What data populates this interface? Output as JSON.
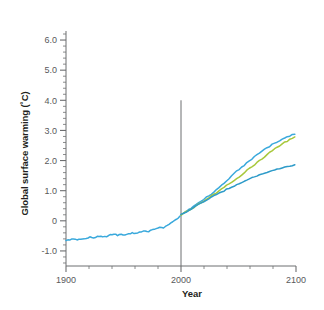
{
  "chart_data": {
    "type": "line",
    "title": "",
    "xlabel": "Year",
    "ylabel": "Global surface warming (˚C)",
    "xlim": [
      1900,
      2100
    ],
    "ylim": [
      -1.5,
      6.3
    ],
    "grid": false,
    "legend": "none",
    "x_major_ticks": [
      1900,
      2000,
      2100
    ],
    "x_major_tick_labels": [
      "1900",
      "2000",
      "2100"
    ],
    "x_minor_tick_step": 20,
    "y_major_ticks": [
      -1.0,
      0,
      1.0,
      2.0,
      3.0,
      4.0,
      5.0,
      6.0
    ],
    "y_major_tick_labels": [
      "-1.0",
      "0",
      "1.0",
      "2.0",
      "3.0",
      "4.0",
      "5.0",
      "6.0"
    ],
    "y_minor_tick_step": 0.2,
    "annotations": [
      {
        "name": "present-day-divider",
        "type": "vline",
        "x": 2000,
        "y_from": -1.5,
        "y_to": 4.0,
        "color": "#6d6e70"
      }
    ],
    "colors": {
      "historical": "#3aa9dc",
      "high_scenario": "#3aa9dc",
      "mid_scenario": "#a8c83c",
      "low_scenario": "#2e9bc9",
      "axis": "#6d6e70",
      "text": "#231f20",
      "tick_text": "#58595b"
    },
    "series": [
      {
        "name": "Historical observations",
        "color": "#3aa9dc",
        "x": [
          1900,
          1903,
          1906,
          1909,
          1912,
          1915,
          1918,
          1921,
          1924,
          1927,
          1930,
          1933,
          1936,
          1939,
          1942,
          1945,
          1948,
          1951,
          1954,
          1957,
          1960,
          1963,
          1966,
          1969,
          1972,
          1975,
          1978,
          1981,
          1984,
          1987,
          1990,
          1993,
          1996,
          1998,
          2000
        ],
        "values": [
          -0.65,
          -0.63,
          -0.6,
          -0.64,
          -0.59,
          -0.61,
          -0.57,
          -0.55,
          -0.57,
          -0.53,
          -0.52,
          -0.54,
          -0.5,
          -0.47,
          -0.45,
          -0.48,
          -0.44,
          -0.46,
          -0.43,
          -0.4,
          -0.42,
          -0.38,
          -0.36,
          -0.33,
          -0.35,
          -0.3,
          -0.26,
          -0.22,
          -0.24,
          -0.17,
          -0.1,
          -0.03,
          0.06,
          0.12,
          0.2
        ]
      },
      {
        "name": "High scenario",
        "color": "#3aa9dc",
        "x": [
          2000,
          2010,
          2020,
          2030,
          2040,
          2050,
          2060,
          2070,
          2080,
          2090,
          2100
        ],
        "values": [
          0.2,
          0.45,
          0.72,
          1.0,
          1.35,
          1.7,
          2.0,
          2.3,
          2.55,
          2.75,
          2.9
        ]
      },
      {
        "name": "Mid scenario",
        "color": "#a8c83c",
        "x": [
          2000,
          2010,
          2020,
          2030,
          2040,
          2050,
          2060,
          2070,
          2080,
          2090,
          2100
        ],
        "values": [
          0.2,
          0.42,
          0.66,
          0.92,
          1.18,
          1.45,
          1.75,
          2.05,
          2.35,
          2.6,
          2.8
        ]
      },
      {
        "name": "Low scenario",
        "color": "#2e9bc9",
        "x": [
          2000,
          2010,
          2020,
          2030,
          2040,
          2050,
          2060,
          2070,
          2080,
          2090,
          2100
        ],
        "values": [
          0.2,
          0.42,
          0.64,
          0.86,
          1.05,
          1.22,
          1.4,
          1.55,
          1.68,
          1.78,
          1.85
        ]
      }
    ]
  }
}
